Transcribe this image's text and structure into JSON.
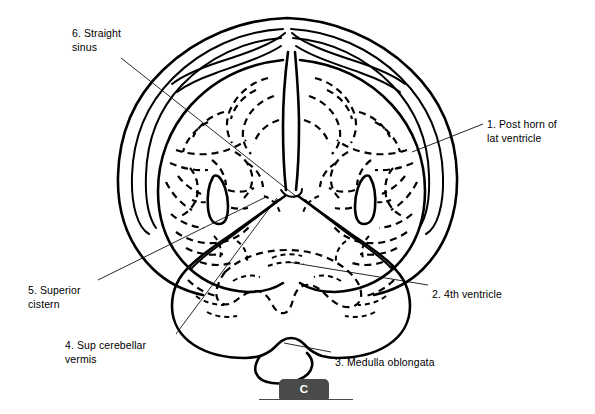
{
  "figure": {
    "type": "anatomical-line-drawing",
    "panel_letter": "C",
    "background_color": "#ffffff",
    "ink_color": "#000000",
    "marker_color": "#4a4a4a"
  },
  "labels": [
    {
      "number": "1",
      "text": "1. Post horn of\nlat ventricle",
      "name": "label-post-horn-lat-ventricle",
      "x": 487,
      "y": 117,
      "align": "left"
    },
    {
      "number": "2",
      "text": "2. 4th ventricle",
      "name": "label-fourth-ventricle",
      "x": 432,
      "y": 287,
      "align": "left"
    },
    {
      "number": "3",
      "text": "3. Medulla oblongata",
      "name": "label-medulla-oblongata",
      "x": 335,
      "y": 355,
      "align": "left"
    },
    {
      "number": "4",
      "text": "4. Sup cerebellar\nvermis",
      "name": "label-sup-cerebellar-vermis",
      "x": 65,
      "y": 338,
      "align": "left"
    },
    {
      "number": "5",
      "text": "5. Superior\ncistern",
      "name": "label-superior-cistern",
      "x": 28,
      "y": 283,
      "align": "left"
    },
    {
      "number": "6",
      "text": "6. Straight\nsinus",
      "name": "label-straight-sinus",
      "x": 72,
      "y": 26,
      "align": "left"
    }
  ],
  "leader_lines": [
    {
      "name": "leader-post-horn-lat-ventricle",
      "x1": 483,
      "y1": 124,
      "x2": 412,
      "y2": 152
    },
    {
      "name": "leader-fourth-ventricle",
      "x1": 428,
      "y1": 285,
      "x2": 288,
      "y2": 262
    },
    {
      "name": "leader-medulla-oblongata",
      "x1": 331,
      "y1": 352,
      "x2": 284,
      "y2": 343
    },
    {
      "name": "leader-sup-cerebellar-vermis",
      "x1": 176,
      "y1": 334,
      "x2": 277,
      "y2": 198
    },
    {
      "name": "leader-superior-cistern",
      "x1": 98,
      "y1": 280,
      "x2": 268,
      "y2": 196
    },
    {
      "name": "leader-straight-sinus",
      "x1": 121,
      "y1": 58,
      "x2": 297,
      "y2": 197
    }
  ],
  "page_marker": {
    "letter": "C",
    "name": "panel-letter-c"
  }
}
